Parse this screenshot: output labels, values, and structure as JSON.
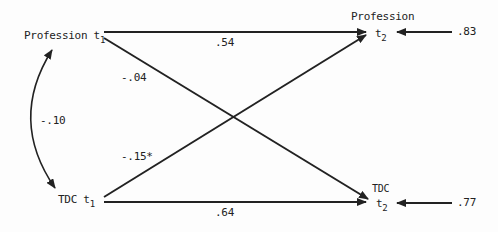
{
  "diagram": {
    "type": "cross-lagged path diagram",
    "nodes": {
      "profession_t1": {
        "name": "Profession t",
        "sub": "1"
      },
      "tdc_t1": {
        "name": "TDC t",
        "sub": "1"
      },
      "profession_t2": {
        "name": "Profession",
        "t": "t",
        "sub": "2"
      },
      "tdc_t2": {
        "name": "TDC",
        "t": "t",
        "sub": "2"
      }
    },
    "paths": {
      "profession_t1_to_profession_t2": ".54",
      "tdc_t1_to_tdc_t2": ".64",
      "profession_t1_to_tdc_t2": "-.04",
      "tdc_t1_to_profession_t2": "-.15*",
      "correlation_t1": "-.10"
    },
    "residuals": {
      "profession_t2": ".83",
      "tdc_t2": ".77"
    }
  }
}
